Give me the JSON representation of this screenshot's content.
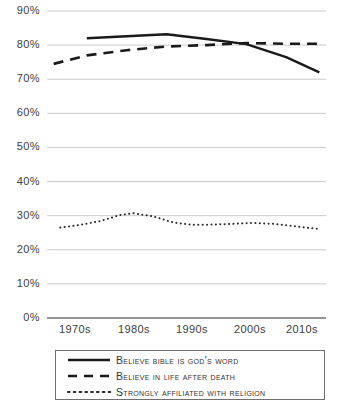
{
  "chart_data": {
    "type": "line",
    "title": "",
    "subtitle": "",
    "xlabel": "",
    "ylabel": "",
    "xlim": [
      1972,
      2014
    ],
    "ylim": [
      0,
      90
    ],
    "grid": true,
    "legend_position": "bottom",
    "y_ticks": [
      "0%",
      "10%",
      "20%",
      "30%",
      "40%",
      "50%",
      "60%",
      "70%",
      "80%",
      "90%"
    ],
    "y_tick_values": [
      0,
      10,
      20,
      30,
      40,
      50,
      60,
      70,
      80,
      90
    ],
    "x_ticks": [
      "1970s",
      "1980s",
      "1990s",
      "2000s",
      "2010s"
    ],
    "x_tick_values": [
      1975,
      1985,
      1995,
      2005,
      2013
    ],
    "series": [
      {
        "name": "Believe bible is God's word",
        "style": "solid",
        "color": "#1a1a1a",
        "x": [
          1978,
          1984,
          1990,
          1996,
          2002,
          2008,
          2013
        ],
        "values": [
          82.0,
          82.6,
          83.2,
          81.8,
          80.3,
          76.5,
          72.0
        ]
      },
      {
        "name": "Believe in life after death",
        "style": "dashed",
        "color": "#1a1a1a",
        "x": [
          1973,
          1978,
          1984,
          1990,
          1996,
          2002,
          2008,
          2013
        ],
        "values": [
          74.5,
          77.0,
          78.5,
          79.6,
          80.0,
          80.6,
          80.4,
          80.4
        ]
      },
      {
        "name": "Strongly affiliated with religion",
        "style": "dotted",
        "color": "#2b2b2b",
        "x": [
          1974,
          1977,
          1980,
          1983,
          1985,
          1988,
          1991,
          1994,
          1997,
          2000,
          2003,
          2006,
          2009,
          2011,
          2013
        ],
        "values": [
          26.5,
          27.3,
          28.4,
          30.2,
          30.7,
          29.8,
          28.0,
          27.3,
          27.4,
          27.6,
          27.9,
          27.6,
          27.0,
          26.5,
          26.1
        ]
      }
    ]
  },
  "legend": {
    "items": [
      {
        "label": "Believe bible is God's word",
        "style": "solid"
      },
      {
        "label": "Believe in life after death",
        "style": "dashed"
      },
      {
        "label": "Strongly affiliated with religion",
        "style": "dotted"
      }
    ]
  },
  "colors": {
    "gridline": "#c9c9c9",
    "axis": "#6f6f6f",
    "series_line": "#1a1a1a",
    "text": "#404040",
    "background": "#ffffff"
  }
}
